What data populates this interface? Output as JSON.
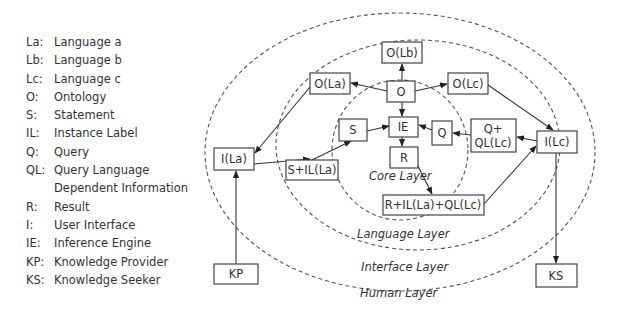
{
  "legend": [
    {
      "key": "La:",
      "value": "Language a"
    },
    {
      "key": "Lb:",
      "value": "Language b"
    },
    {
      "key": "Lc:",
      "value": "Language c"
    },
    {
      "key": "O:",
      "value": "Ontology"
    },
    {
      "key": "S:",
      "value": "Statement"
    },
    {
      "key": "IL:",
      "value": "Instance Label"
    },
    {
      "key": "Q:",
      "value": "Query"
    },
    {
      "key": "QL:",
      "value": "Query Language"
    },
    {
      "key": "",
      "value": "Dependent Information"
    },
    {
      "key": "R:",
      "value": "Result"
    },
    {
      "key": "I:",
      "value": "User Interface"
    },
    {
      "key": "IE:",
      "value": "Inference Engine"
    },
    {
      "key": "KP:",
      "value": "Knowledge Provider"
    },
    {
      "key": "KS:",
      "value": "Knowledge Seeker"
    }
  ],
  "layers": {
    "core": "Core Layer",
    "language": "Language Layer",
    "interface": "Interface Layer",
    "human": "Human Layer"
  },
  "nodes": {
    "o_lb": "O(Lb)",
    "o_la": "O(La)",
    "o": "O",
    "o_lc": "O(Lc)",
    "i_la": "I(La)",
    "s": "S",
    "ie": "IE",
    "q": "Q",
    "q_ql_lc_line1": "Q+",
    "q_ql_lc_line2": "QL(Lc)",
    "i_lc": "I(Lc)",
    "r": "R",
    "s_il_la": "S+IL(La)",
    "r_il_la_ql_lc": "R+IL(La)+QL(Lc)",
    "kp": "KP",
    "ks": "KS"
  },
  "edges": [
    {
      "from": "O",
      "to": "O(Lb)"
    },
    {
      "from": "O",
      "to": "O(La)"
    },
    {
      "from": "O",
      "to": "O(Lc)"
    },
    {
      "from": "O",
      "to": "IE"
    },
    {
      "from": "O(La)",
      "to": "I(La)"
    },
    {
      "from": "O(Lc)",
      "to": "I(Lc)"
    },
    {
      "from": "KP",
      "to": "I(La)"
    },
    {
      "from": "I(La)",
      "to": "S+IL(La)"
    },
    {
      "from": "S+IL(La)",
      "to": "S"
    },
    {
      "from": "S",
      "to": "IE"
    },
    {
      "from": "Q",
      "to": "IE"
    },
    {
      "from": "Q+QL(Lc)",
      "to": "Q"
    },
    {
      "from": "I(Lc)",
      "to": "Q+QL(Lc)"
    },
    {
      "from": "IE",
      "to": "R"
    },
    {
      "from": "R",
      "to": "R+IL(La)+QL(Lc)"
    },
    {
      "from": "R+IL(La)+QL(Lc)",
      "to": "I(Lc)"
    },
    {
      "from": "I(Lc)",
      "to": "KS"
    }
  ]
}
